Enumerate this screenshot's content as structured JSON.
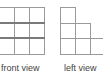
{
  "views": [
    {
      "name": "front view",
      "label": "front view",
      "columns": [
        3,
        3,
        3
      ]
    },
    {
      "name": "left view",
      "label": "left view",
      "columns": [
        3,
        2,
        1
      ]
    }
  ],
  "colors": {
    "line": "#9a9a9a",
    "thick_line": "#7a7a7a",
    "text": "#444444"
  }
}
